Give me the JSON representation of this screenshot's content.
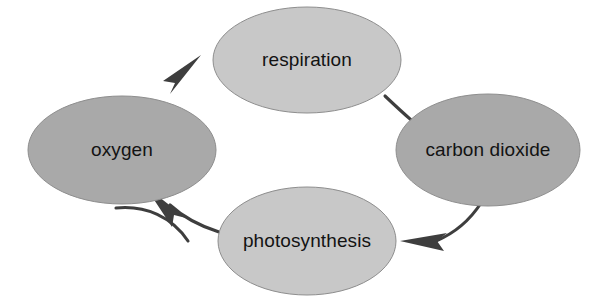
{
  "diagram": {
    "type": "cycle-diagram",
    "background_color": "#ffffff",
    "canvas": {
      "width": 603,
      "height": 296
    },
    "nodes": [
      {
        "id": "oxygen",
        "label": "oxygen",
        "position": "left",
        "fill": "#a9a9a9",
        "stroke": "#8e8e8e",
        "cx": 122,
        "cy": 150,
        "rx": 94,
        "ry": 54
      },
      {
        "id": "respiration",
        "label": "respiration",
        "position": "top",
        "fill": "#c8c8c8",
        "stroke": "#8e8e8e",
        "cx": 307,
        "cy": 60,
        "rx": 94,
        "ry": 53
      },
      {
        "id": "carbon-dioxide",
        "label": "carbon dioxide",
        "position": "right",
        "fill": "#a9a9a9",
        "stroke": "#8e8e8e",
        "cx": 488,
        "cy": 150,
        "rx": 92,
        "ry": 56
      },
      {
        "id": "photosynthesis",
        "label": "photosynthesis",
        "position": "bottom",
        "fill": "#c8c8c8",
        "stroke": "#8e8e8e",
        "cx": 307,
        "cy": 241,
        "rx": 89,
        "ry": 54
      }
    ],
    "arrows": [
      {
        "id": "oxygen-to-respiration",
        "from": "oxygen",
        "to": "respiration",
        "color": "#3e3e3e"
      },
      {
        "id": "respiration-to-carbon-dioxide",
        "from": "respiration",
        "to": "carbon-dioxide",
        "color": "#3e3e3e"
      },
      {
        "id": "carbon-dioxide-to-photosynthesis",
        "from": "carbon-dioxide",
        "to": "photosynthesis",
        "color": "#3e3e3e"
      },
      {
        "id": "photosynthesis-to-oxygen",
        "from": "photosynthesis",
        "to": "oxygen",
        "color": "#3e3e3e"
      }
    ]
  }
}
